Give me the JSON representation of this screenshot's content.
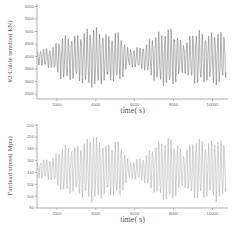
{
  "chart_data": [
    {
      "type": "line",
      "title": "",
      "xlabel": "time( s)",
      "ylabel": "#2 Cable tension( kN)",
      "xlim": [
        980,
        10800
      ],
      "ylim": [
        2300,
        6100
      ],
      "xticks": [
        2000,
        4000,
        6000,
        8000,
        10000
      ],
      "yticks": [
        2500,
        3000,
        3500,
        4000,
        4500,
        5000,
        5500,
        6000
      ],
      "grid": false,
      "legend": null,
      "line_color": "#555555",
      "series": [
        {
          "name": "#2 Cable tension",
          "mean": 3950,
          "period_s": 160,
          "envelope": [
            {
              "t": 1000,
              "amp": 300
            },
            {
              "t": 1800,
              "amp": 450
            },
            {
              "t": 2300,
              "amp": 900
            },
            {
              "t": 3000,
              "amp": 900
            },
            {
              "t": 3900,
              "amp": 1250
            },
            {
              "t": 4600,
              "amp": 900
            },
            {
              "t": 5200,
              "amp": 1050
            },
            {
              "t": 5700,
              "amp": 350
            },
            {
              "t": 6400,
              "amp": 450
            },
            {
              "t": 7000,
              "amp": 900
            },
            {
              "t": 7800,
              "amp": 1250
            },
            {
              "t": 8500,
              "amp": 600
            },
            {
              "t": 9200,
              "amp": 1150
            },
            {
              "t": 9800,
              "amp": 950
            },
            {
              "t": 10300,
              "amp": 1150
            },
            {
              "t": 10800,
              "amp": 700
            }
          ]
        }
      ]
    },
    {
      "type": "line",
      "title": "",
      "xlabel": "time( s)",
      "ylabel": "Fairlead stress( Mpa)",
      "xlim": [
        980,
        10800
      ],
      "ylim": [
        80,
        222
      ],
      "xticks": [
        2000,
        4000,
        6000,
        8000,
        10000
      ],
      "yticks": [
        80,
        100,
        120,
        140,
        160,
        180,
        200,
        220
      ],
      "grid": false,
      "legend": null,
      "line_color": "#9a9a9a",
      "series": [
        {
          "name": "Fairlead stress",
          "mean": 145,
          "period_s": 160,
          "envelope": [
            {
              "t": 1000,
              "amp": 14
            },
            {
              "t": 1800,
              "amp": 20
            },
            {
              "t": 2300,
              "amp": 40
            },
            {
              "t": 3000,
              "amp": 40
            },
            {
              "t": 3900,
              "amp": 60
            },
            {
              "t": 4600,
              "amp": 42
            },
            {
              "t": 5200,
              "amp": 50
            },
            {
              "t": 5700,
              "amp": 15
            },
            {
              "t": 6400,
              "amp": 20
            },
            {
              "t": 7000,
              "amp": 40
            },
            {
              "t": 7800,
              "amp": 58
            },
            {
              "t": 8500,
              "amp": 30
            },
            {
              "t": 9200,
              "amp": 55
            },
            {
              "t": 9800,
              "amp": 45
            },
            {
              "t": 10300,
              "amp": 58
            },
            {
              "t": 10800,
              "amp": 35
            }
          ]
        }
      ]
    }
  ]
}
